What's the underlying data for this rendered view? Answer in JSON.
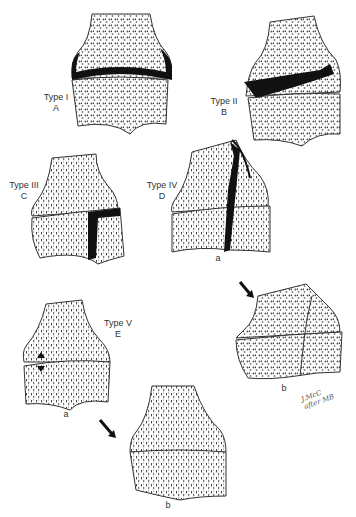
{
  "figure": {
    "panels": [
      {
        "id": "A",
        "type_label": "Type I",
        "letter": "A"
      },
      {
        "id": "B",
        "type_label": "Type II",
        "letter": "B"
      },
      {
        "id": "C",
        "type_label": "Type III",
        "letter": "C"
      },
      {
        "id": "D",
        "type_label": "Type IV",
        "letter": "D",
        "sub_a": "a",
        "sub_b": "b"
      },
      {
        "id": "E",
        "type_label": "Type V",
        "letter": "E",
        "sub_a": "a",
        "sub_b": "b"
      }
    ],
    "signature": {
      "line1": "J.McC",
      "line2": "after MB"
    }
  }
}
